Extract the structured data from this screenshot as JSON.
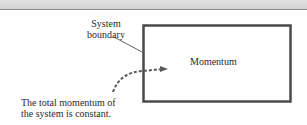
{
  "diagram": {
    "boundary_label_line1": "System",
    "boundary_label_line2": "boundary",
    "box_label": "Momentum",
    "caption_line1": "The total momentum of",
    "caption_line2": "the system is constant.",
    "colors": {
      "box_border": "#4a4a4a",
      "arrow": "#5a5a5a",
      "text": "#2a2a2a",
      "band": "#d8d8d8"
    }
  }
}
